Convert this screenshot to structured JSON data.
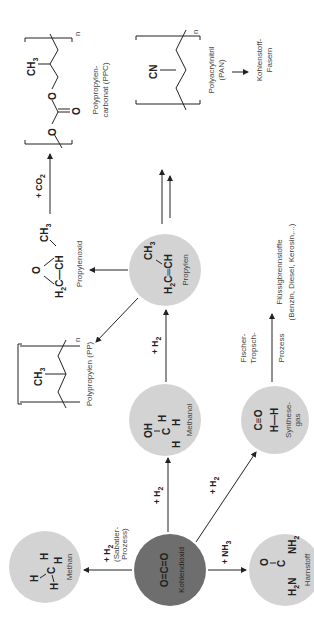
{
  "diagram": {
    "orientation": "rotated-90-ccw",
    "colors": {
      "circle_light": "#d3d3d3",
      "circle_dark": "#6e6e6e",
      "line": "#333333",
      "text": "#222222"
    },
    "nodes": {
      "co2": {
        "formula": "O=C=O",
        "label": "Kohlendioxid"
      },
      "methan": {
        "label": "Methan"
      },
      "harnstoff": {
        "label": "Harnstoff"
      },
      "methanol": {
        "label": "Methanol"
      },
      "synthesegas": {
        "label": "Synthese-",
        "label2": "gas"
      },
      "propylen": {
        "label": "Propylen"
      },
      "propylenoxid": {
        "label": "Propylenoxid"
      },
      "pp": {
        "label": "Polypropylen (PP)"
      },
      "ppc": {
        "label": "Polypropylen-",
        "label2": "carbonat (PPC)"
      },
      "pan": {
        "label": "Polyacrylnitril",
        "label2": "(PAN)"
      },
      "fasern": {
        "label": "Kohlenstoff-",
        "label2": "Fasern"
      },
      "fluessig": {
        "label": "Flüssigbrennstoffe",
        "label2": "(Benzin, Diesel, Kerosin,...)"
      }
    },
    "reactions": {
      "co2_methan": {
        "reagent": "+ H",
        "sub": "2",
        "note1": "(Sabatier-",
        "note2": "Prozess)"
      },
      "co2_methanol": {
        "reagent": "+ H",
        "sub": "2"
      },
      "co2_synthesegas": {
        "reagent": "+ H",
        "sub": "2"
      },
      "co2_harnstoff": {
        "reagent": "+ NH",
        "sub": "3"
      },
      "methanol_propylen": {
        "reagent": "+ H",
        "sub": "2"
      },
      "propylenoxid_ppc": {
        "reagent": "+ CO",
        "sub": "2"
      },
      "fischer_tropsch": {
        "line1": "Fischer-",
        "line2": "Tropsch-",
        "line3": "Prozess"
      }
    },
    "structures": {
      "ch3": "CH",
      "cn": "CN",
      "oh": "OH",
      "n": "n",
      "o": "O",
      "h": "H",
      "c": "C",
      "h2c": "H",
      "nh2": "NH",
      "ch": "CH",
      "co_triple": "C≡O",
      "hh": "H—H"
    }
  }
}
